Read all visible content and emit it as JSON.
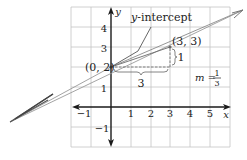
{
  "diagram": {
    "type": "coordinate-plane-line",
    "x_axis": {
      "label": "x",
      "ticks": [
        "−1",
        "1",
        "2",
        "3",
        "4",
        "5"
      ],
      "range": [
        -2,
        6
      ]
    },
    "y_axis": {
      "label": "y",
      "ticks": [
        "4",
        "3",
        "2",
        "1",
        "−1"
      ],
      "range": [
        -2,
        5
      ]
    },
    "points": [
      {
        "label": "(0, 2)",
        "x": 0,
        "y": 2
      },
      {
        "label": "(3, 3)",
        "x": 3,
        "y": 3
      }
    ],
    "annotations": {
      "y_intercept": "y-intercept",
      "y_intercept_prefix": "y",
      "y_intercept_suffix": "-intercept",
      "run": "3",
      "rise": "1",
      "slope_prefix": "m =",
      "slope_num": "1",
      "slope_den": "3"
    },
    "colors": {
      "grid": "#b8b8b8",
      "axis": "#1a1a1a",
      "line": "#8a8a8a",
      "dashed": "#777777",
      "text": "#222222"
    }
  }
}
